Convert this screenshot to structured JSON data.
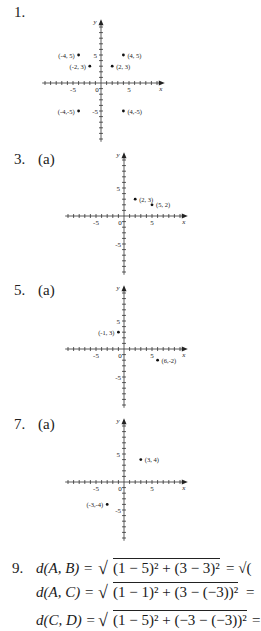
{
  "problems": [
    {
      "number": "1.",
      "part": ""
    },
    {
      "number": "3.",
      "part": "(a)"
    },
    {
      "number": "5.",
      "part": "(a)"
    },
    {
      "number": "7.",
      "part": "(a)"
    },
    {
      "number": "9.",
      "part": ""
    }
  ],
  "axis_labels": {
    "x": "x",
    "y": "y",
    "origin": "0",
    "pos5": "5",
    "neg5": "-5"
  },
  "chart_data": [
    {
      "type": "scatter",
      "title": "1.",
      "xlabel": "x",
      "ylabel": "y",
      "xlim": [
        -10,
        10
      ],
      "ylim": [
        -10,
        10
      ],
      "ticks": [
        -5,
        0,
        5
      ],
      "points": [
        {
          "x": -4,
          "y": 5,
          "label": "(-4, 5)"
        },
        {
          "x": 4,
          "y": 5,
          "label": "(4, 5)"
        },
        {
          "x": -2,
          "y": 3,
          "label": "(-2, 3)"
        },
        {
          "x": 2,
          "y": 3,
          "label": "(2, 3)"
        },
        {
          "x": -4,
          "y": -5,
          "label": "(-4,-5)"
        },
        {
          "x": 4,
          "y": -5,
          "label": "(4,-5)"
        }
      ]
    },
    {
      "type": "scatter",
      "title": "3. (a)",
      "xlabel": "x",
      "ylabel": "y",
      "xlim": [
        -10,
        10
      ],
      "ylim": [
        -10,
        10
      ],
      "ticks": [
        -5,
        0,
        5
      ],
      "points": [
        {
          "x": 2,
          "y": 3,
          "label": "(2, 3)"
        },
        {
          "x": 5,
          "y": 2,
          "label": "(5, 2)"
        }
      ]
    },
    {
      "type": "scatter",
      "title": "5. (a)",
      "xlabel": "x",
      "ylabel": "y",
      "xlim": [
        -10,
        10
      ],
      "ylim": [
        -10,
        10
      ],
      "ticks": [
        -5,
        0,
        5
      ],
      "points": [
        {
          "x": -1,
          "y": 3,
          "label": "(-1, 3)"
        },
        {
          "x": 6,
          "y": -2,
          "label": "(6,-2)"
        }
      ]
    },
    {
      "type": "scatter",
      "title": "7. (a)",
      "xlabel": "x",
      "ylabel": "y",
      "xlim": [
        -10,
        10
      ],
      "ylim": [
        -10,
        10
      ],
      "ticks": [
        -5,
        0,
        5
      ],
      "points": [
        {
          "x": 3,
          "y": 4,
          "label": "(3, 4)"
        },
        {
          "x": -3,
          "y": -4,
          "label": "(-3,-4)"
        }
      ]
    }
  ],
  "equations": [
    {
      "lhs": "d(A, B) =",
      "rad": "(1 − 5)² + (3 − 3)²",
      "tail": "= √("
    },
    {
      "lhs": "d(A, C) =",
      "rad": "(1 − 1)² + (3 − (−3))²",
      "tail": "="
    },
    {
      "lhs": "d(C, D) =",
      "rad": "(1 − 5)² + (−3 − (−3))²",
      "tail": "="
    }
  ]
}
